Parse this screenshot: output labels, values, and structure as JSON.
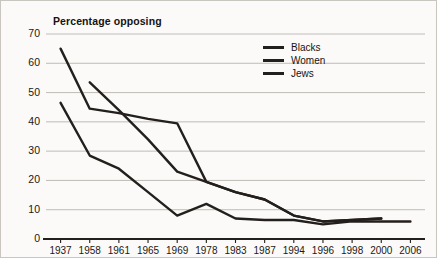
{
  "chart_data": {
    "type": "line",
    "title": "Percentage opposing",
    "xlabel": "",
    "ylabel": "Percentage opposing",
    "ylim": [
      0,
      70
    ],
    "ytick_step": 10,
    "yticks": [
      70,
      60,
      50,
      40,
      30,
      20,
      10,
      0
    ],
    "grid": true,
    "legend_position": "top-right",
    "categories": [
      "1937",
      "1958",
      "1961",
      "1965",
      "1969",
      "1978",
      "1983",
      "1987",
      "1994",
      "1996",
      "1998",
      "2000",
      "2006"
    ],
    "series": [
      {
        "name": "Blacks",
        "color": "#231f1c",
        "values": [
          65,
          44.5,
          43,
          41,
          39.5,
          19.5,
          16,
          13.5,
          8,
          6,
          6.5,
          7,
          null
        ]
      },
      {
        "name": "Women",
        "color": "#231f1c",
        "values": [
          null,
          53.5,
          44,
          34,
          23,
          19.5,
          16,
          13.5,
          8,
          6,
          6.5,
          7,
          null
        ]
      },
      {
        "name": "Jews",
        "color": "#231f1c",
        "values": [
          46.5,
          28.5,
          24,
          16,
          8,
          12,
          7,
          6.5,
          6.5,
          5,
          6,
          6,
          6
        ]
      }
    ]
  },
  "legend": {
    "items": [
      {
        "label": "Blacks"
      },
      {
        "label": "Women"
      },
      {
        "label": "Jews"
      }
    ]
  }
}
